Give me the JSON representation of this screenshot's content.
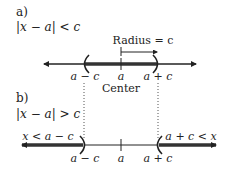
{
  "part_a": {
    "label": "a)",
    "inequality": "|x − a| < c",
    "radius_label": "Radius = c",
    "left_label": "a − c",
    "center_label": "a",
    "right_label": "a + c",
    "center_caption": "Center"
  },
  "part_b": {
    "label": "b)",
    "inequality": "|x − a| > c",
    "left_region_label": "x < a − c",
    "right_region_label": "a + c < x",
    "left_label": "a − c",
    "center_label": "a",
    "right_label": "a + c"
  },
  "colors": {
    "line": "#222222",
    "thick": "#333333",
    "dotted": "#555555"
  }
}
